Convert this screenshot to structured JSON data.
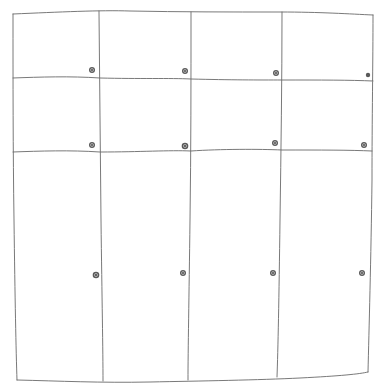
{
  "sketch": {
    "subject": "cabinet-front",
    "stroke_color": "#6a6a6a",
    "knob_color": "#5a5a5a",
    "background": "#ffffff",
    "rows": 3,
    "columns": 4,
    "doors": [
      {
        "row": 1,
        "col": 1,
        "knob": [
          92,
          70
        ]
      },
      {
        "row": 1,
        "col": 2,
        "knob": [
          185,
          71
        ]
      },
      {
        "row": 1,
        "col": 3,
        "knob": [
          276,
          73
        ]
      },
      {
        "row": 1,
        "col": 4,
        "knob": [
          368,
          75
        ]
      },
      {
        "row": 2,
        "col": 1,
        "knob": [
          92,
          145
        ]
      },
      {
        "row": 2,
        "col": 2,
        "knob": [
          185,
          146
        ]
      },
      {
        "row": 2,
        "col": 3,
        "knob": [
          275,
          143
        ]
      },
      {
        "row": 2,
        "col": 4,
        "knob": [
          364,
          145
        ]
      },
      {
        "row": 3,
        "col": 1,
        "knob": [
          96,
          275
        ]
      },
      {
        "row": 3,
        "col": 2,
        "knob": [
          183,
          273
        ]
      },
      {
        "row": 3,
        "col": 3,
        "knob": [
          273,
          273
        ]
      },
      {
        "row": 3,
        "col": 4,
        "knob": [
          362,
          273
        ]
      }
    ]
  }
}
